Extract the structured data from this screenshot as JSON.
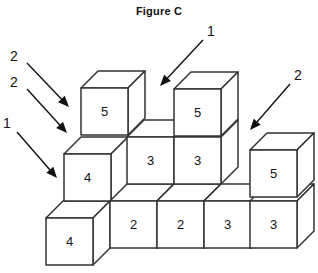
{
  "figure": {
    "title": "Figure C",
    "type": "isometric-cube-stack-diagram",
    "canvas": {
      "width": 318,
      "height": 273
    },
    "geometry": {
      "face_width": 47,
      "face_height": 47,
      "depth_dx": 17,
      "depth_dy": -17,
      "origin_x": 46,
      "origin_y": 265,
      "note": "origin is bottom-left front corner of the front-left-most cube column"
    },
    "cubes": [
      {
        "id": "cube-bottom-left-4",
        "label": "4",
        "col": 0,
        "row": 0,
        "level": 0,
        "x": 46,
        "y": 218
      },
      {
        "id": "cube-left-4",
        "label": "4",
        "col": 1,
        "row": 1,
        "level": 1,
        "x": 64,
        "y": 154
      },
      {
        "id": "cube-left-5",
        "label": "5",
        "col": 1,
        "row": 2,
        "level": 2,
        "x": 81,
        "y": 88
      },
      {
        "id": "cube-mid1-2",
        "label": "2",
        "col": 1,
        "row": 0,
        "level": 0,
        "x": 110,
        "y": 201
      },
      {
        "id": "cube-mid1-3",
        "label": "3",
        "col": 2,
        "row": 1,
        "level": 1,
        "x": 127,
        "y": 137
      },
      {
        "id": "cube-mid2-2",
        "label": "2",
        "col": 2,
        "row": 0,
        "level": 0,
        "x": 157,
        "y": 201
      },
      {
        "id": "cube-mid2-3",
        "label": "3",
        "col": 3,
        "row": 1,
        "level": 1,
        "x": 174,
        "y": 137
      },
      {
        "id": "cube-mid2-5",
        "label": "5",
        "col": 3,
        "row": 2,
        "level": 2,
        "x": 174,
        "y": 89
      },
      {
        "id": "cube-mid3-3",
        "label": "3",
        "col": 3,
        "row": 0,
        "level": 0,
        "x": 204,
        "y": 201
      },
      {
        "id": "cube-right-3",
        "label": "3",
        "col": 4,
        "row": 0,
        "level": 0,
        "x": 250,
        "y": 201
      },
      {
        "id": "cube-right-5",
        "label": "5",
        "col": 4,
        "row": 1,
        "level": 1,
        "x": 250,
        "y": 150
      }
    ],
    "callouts": [
      {
        "id": "callout-left-2-upper",
        "label": "2",
        "label_x": 14,
        "label_y": 57,
        "line_from_x": 27,
        "line_from_y": 63,
        "line_to_x": 69,
        "line_to_y": 107,
        "direction": "down-right"
      },
      {
        "id": "callout-left-2-lower",
        "label": "2",
        "label_x": 14,
        "label_y": 83,
        "line_from_x": 27,
        "line_from_y": 89,
        "line_to_x": 67,
        "line_to_y": 133,
        "direction": "down-right"
      },
      {
        "id": "callout-left-1",
        "label": "1",
        "label_x": 7,
        "label_y": 124,
        "line_from_x": 17,
        "line_from_y": 132,
        "line_to_x": 57,
        "line_to_y": 178,
        "direction": "down-right"
      },
      {
        "id": "callout-top-1",
        "label": "1",
        "label_x": 211,
        "label_y": 32,
        "line_from_x": 203,
        "line_from_y": 40,
        "line_to_x": 160,
        "line_to_y": 86,
        "direction": "down-left"
      },
      {
        "id": "callout-right-2",
        "label": "2",
        "label_x": 298,
        "label_y": 76,
        "line_from_x": 290,
        "line_from_y": 84,
        "line_to_x": 250,
        "line_to_y": 130,
        "direction": "down-left"
      }
    ]
  }
}
